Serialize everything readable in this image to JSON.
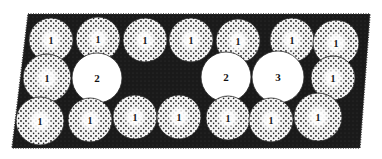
{
  "figure": {
    "background": "#ffffff",
    "frame": {
      "shape": "parallelogram",
      "fill": "#1a1a1a",
      "points": [
        [
          28,
          14
        ],
        [
          370,
          14
        ],
        [
          360,
          148
        ],
        [
          12,
          148
        ]
      ]
    },
    "colors": {
      "stippled_circle_fill": "#f4f4f4",
      "stipple_dot": "#222222",
      "plain_circle_fill": "#ffffff",
      "label": "#111111"
    },
    "circles": [
      {
        "row": "top",
        "cx": 51,
        "cy": 40,
        "r": 22,
        "label": "1",
        "stippled": true
      },
      {
        "row": "top",
        "cx": 98,
        "cy": 39,
        "r": 22,
        "label": "1",
        "stippled": true
      },
      {
        "row": "top",
        "cx": 145,
        "cy": 40,
        "r": 22,
        "label": "1",
        "stippled": true
      },
      {
        "row": "top",
        "cx": 191,
        "cy": 40,
        "r": 22,
        "label": "1",
        "stippled": true
      },
      {
        "row": "top",
        "cx": 238,
        "cy": 41,
        "r": 22,
        "label": "1",
        "stippled": true
      },
      {
        "row": "top",
        "cx": 292,
        "cy": 40,
        "r": 22,
        "label": "1",
        "stippled": true
      },
      {
        "row": "top",
        "cx": 336,
        "cy": 43,
        "r": 23,
        "label": "1",
        "stippled": true
      },
      {
        "row": "middle",
        "cx": 47,
        "cy": 78,
        "r": 24,
        "label": "1",
        "stippled": true
      },
      {
        "row": "middle",
        "cx": 97,
        "cy": 78,
        "r": 25,
        "label": "2",
        "stippled": false
      },
      {
        "row": "middle",
        "cx": 226,
        "cy": 77,
        "r": 25,
        "label": "2",
        "stippled": false
      },
      {
        "row": "middle",
        "cx": 278,
        "cy": 77,
        "r": 26,
        "label": "3",
        "stippled": false
      },
      {
        "row": "middle",
        "cx": 333,
        "cy": 78,
        "r": 22,
        "label": "1",
        "stippled": true
      },
      {
        "row": "bottom",
        "cx": 40,
        "cy": 121,
        "r": 24,
        "label": "1",
        "stippled": true
      },
      {
        "row": "bottom",
        "cx": 90,
        "cy": 120,
        "r": 22,
        "label": "1",
        "stippled": true
      },
      {
        "row": "bottom",
        "cx": 135,
        "cy": 117,
        "r": 22,
        "label": "1",
        "stippled": true
      },
      {
        "row": "bottom",
        "cx": 179,
        "cy": 117,
        "r": 22,
        "label": "1",
        "stippled": true
      },
      {
        "row": "bottom",
        "cx": 228,
        "cy": 118,
        "r": 22,
        "label": "1",
        "stippled": true
      },
      {
        "row": "bottom",
        "cx": 271,
        "cy": 120,
        "r": 22,
        "label": "1",
        "stippled": true
      },
      {
        "row": "bottom",
        "cx": 318,
        "cy": 117,
        "r": 24,
        "label": "1",
        "stippled": true
      }
    ]
  }
}
